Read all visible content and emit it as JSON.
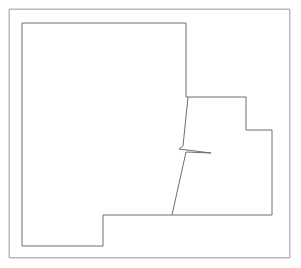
{
  "figure": {
    "width": 301,
    "height": 268,
    "background_color": "#ffffff"
  },
  "colors": {
    "background": "#ffffff",
    "frame_stroke": "#b9b9b9",
    "outline_stroke": "#6e6e6e",
    "fill": "#ffffff"
  },
  "frame": {
    "name": "image-border",
    "x": 9,
    "y": 9,
    "width": 281,
    "height": 249,
    "stroke_width": 1
  },
  "shapes": {
    "region_outline": {
      "name": "region-outline",
      "closed": true,
      "stroke_width": 1,
      "points": "22,23 186,23 186,97 246,97 246,130 272,130 272,215 103,215 103,246 22,246"
    },
    "internal_boundary": {
      "name": "internal-boundary-line",
      "closed": false,
      "stroke_width": 1,
      "points": "188,97 183,146 179,149 211,153 186,152 172,215"
    }
  }
}
